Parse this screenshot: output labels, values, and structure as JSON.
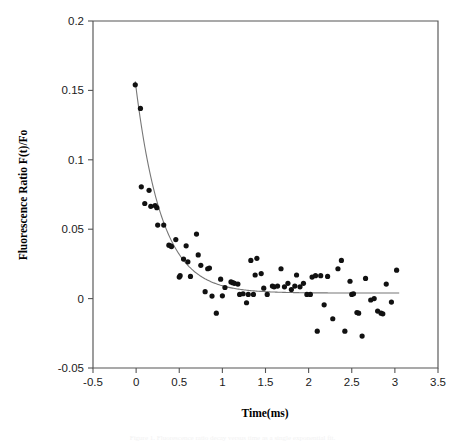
{
  "figure": {
    "background_color": "#ffffff",
    "caption_partial": "Figure 1. Fluorescence ratio decay versus time as a single exponential fit."
  },
  "chart_data": {
    "type": "scatter",
    "title": "",
    "xlabel": "Time(ms)",
    "ylabel": "Fluorescence Ratio  F(t)/Fo",
    "xlim": [
      -0.5,
      3.5
    ],
    "ylim": [
      -0.05,
      0.2
    ],
    "xticks": [
      -0.5,
      0,
      0.5,
      1,
      1.5,
      2,
      2.5,
      3,
      3.5
    ],
    "xtick_labels": [
      "-0.5",
      "0",
      "0.5",
      "1",
      "1.5",
      "2",
      "2.5",
      "3",
      "3.5"
    ],
    "yticks": [
      -0.05,
      0,
      0.05,
      0.1,
      0.15,
      0.2
    ],
    "ytick_labels": [
      "-0.05",
      "0",
      "0.05",
      "0.1",
      "0.15",
      "0.2"
    ],
    "grid": false,
    "legend": "none",
    "marker": {
      "shape": "circle",
      "color": "#111111",
      "size_px": 5.2
    },
    "series": [
      {
        "name": "Fluorescence ratio data",
        "marker_color": "#111111",
        "points": [
          [
            -0.01,
            0.154
          ],
          [
            0.05,
            0.137
          ],
          [
            0.06,
            0.0805
          ],
          [
            0.1,
            0.0685
          ],
          [
            0.15,
            0.078
          ],
          [
            0.17,
            0.0665
          ],
          [
            0.22,
            0.067
          ],
          [
            0.24,
            0.0655
          ],
          [
            0.25,
            0.053
          ],
          [
            0.32,
            0.053
          ],
          [
            0.38,
            0.0385
          ],
          [
            0.4,
            0.038
          ],
          [
            0.41,
            0.0375
          ],
          [
            0.46,
            0.0425
          ],
          [
            0.5,
            0.0155
          ],
          [
            0.51,
            0.0165
          ],
          [
            0.55,
            0.0285
          ],
          [
            0.58,
            0.038
          ],
          [
            0.6,
            0.0265
          ],
          [
            0.63,
            0.016
          ],
          [
            0.7,
            0.0465
          ],
          [
            0.72,
            0.0315
          ],
          [
            0.75,
            0.024
          ],
          [
            0.8,
            0.005
          ],
          [
            0.83,
            0.0215
          ],
          [
            0.85,
            0.022
          ],
          [
            0.88,
            0.0018
          ],
          [
            0.93,
            -0.0105
          ],
          [
            0.98,
            0.014
          ],
          [
            1.0,
            0.002
          ],
          [
            1.03,
            0.008
          ],
          [
            1.1,
            0.012
          ],
          [
            1.12,
            0.0115
          ],
          [
            1.14,
            0.011
          ],
          [
            1.18,
            0.0105
          ],
          [
            1.2,
            0.003
          ],
          [
            1.24,
            0.0035
          ],
          [
            1.28,
            -0.003
          ],
          [
            1.3,
            0.003
          ],
          [
            1.33,
            0.0275
          ],
          [
            1.36,
            0.003
          ],
          [
            1.38,
            0.017
          ],
          [
            1.4,
            0.029
          ],
          [
            1.45,
            0.018
          ],
          [
            1.48,
            0.0075
          ],
          [
            1.52,
            0.003
          ],
          [
            1.58,
            0.009
          ],
          [
            1.6,
            0.0085
          ],
          [
            1.64,
            0.009
          ],
          [
            1.68,
            0.0215
          ],
          [
            1.72,
            0.0085
          ],
          [
            1.76,
            0.011
          ],
          [
            1.8,
            0.0065
          ],
          [
            1.84,
            0.009
          ],
          [
            1.86,
            0.017
          ],
          [
            1.9,
            0.0085
          ],
          [
            1.94,
            0.011
          ],
          [
            1.98,
            0.003
          ],
          [
            2.02,
            0.003
          ],
          [
            2.04,
            0.0155
          ],
          [
            2.08,
            0.0165
          ],
          [
            2.1,
            -0.0235
          ],
          [
            2.14,
            0.0165
          ],
          [
            2.18,
            -0.0045
          ],
          [
            2.22,
            0.016
          ],
          [
            2.28,
            -0.0145
          ],
          [
            2.34,
            0.0215
          ],
          [
            2.38,
            0.0275
          ],
          [
            2.42,
            -0.0235
          ],
          [
            2.48,
            0.0125
          ],
          [
            2.5,
            0.003
          ],
          [
            2.52,
            0.0035
          ],
          [
            2.56,
            -0.01
          ],
          [
            2.58,
            -0.0105
          ],
          [
            2.62,
            -0.027
          ],
          [
            2.66,
            0.0145
          ],
          [
            2.72,
            -0.001
          ],
          [
            2.76,
            0.0
          ],
          [
            2.8,
            -0.009
          ],
          [
            2.84,
            -0.0105
          ],
          [
            2.86,
            -0.011
          ],
          [
            2.9,
            0.0105
          ],
          [
            2.96,
            -0.0025
          ],
          [
            3.02,
            0.0205
          ]
        ]
      }
    ],
    "fit": {
      "name": "Exponential fit",
      "color": "#777777",
      "model": "single exponential decay to baseline",
      "t_start": -0.01,
      "t_end": 3.05,
      "amplitude": 0.1525,
      "tau": 0.3,
      "baseline": 0.004
    }
  }
}
